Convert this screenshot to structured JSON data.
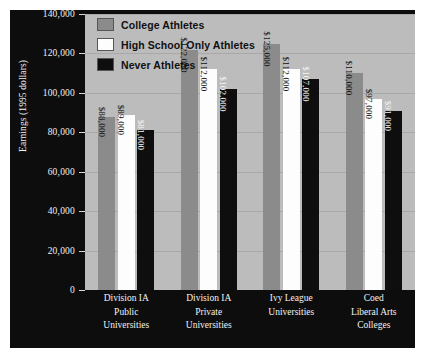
{
  "chart_data": {
    "type": "bar",
    "title": "",
    "subtitle": "",
    "xlabel": "",
    "ylabel": "Earnings (1995 dollars)",
    "ylim": [
      0,
      140000
    ],
    "ytick_values": [
      0,
      20000,
      40000,
      60000,
      80000,
      100000,
      120000,
      140000
    ],
    "ytick_labels": [
      "0",
      "20,000",
      "40,000",
      "60,000",
      "80,000",
      "100,000",
      "120,000",
      "140,000"
    ],
    "grid": true,
    "legend_position": "top-left",
    "categories": [
      "Division IA Public Universities",
      "Division IA Private Universities",
      "Ivy League Universities",
      "Coed Liberal Arts Colleges"
    ],
    "category_lines": [
      [
        "Division IA",
        "Public",
        "Universities"
      ],
      [
        "Division IA",
        "Private",
        "Universities"
      ],
      [
        "Ivy League",
        "Universities"
      ],
      [
        "Coed",
        "Liberal Arts",
        "Colleges"
      ]
    ],
    "series": [
      {
        "name": "College Athletes",
        "color": "#8b8b8b",
        "values": [
          88000,
          122000,
          125000,
          110000
        ],
        "labels": [
          "$88,000",
          "$122,000",
          "$125,000",
          "$110,000"
        ]
      },
      {
        "name": "High School Only Athletes",
        "color": "#fdfdfd",
        "values": [
          89000,
          112000,
          112000,
          97000
        ],
        "labels": [
          "$89,000",
          "$112,000",
          "$112,000",
          "$97,000"
        ]
      },
      {
        "name": "Never Athletes",
        "color": "#0e0e0e",
        "values": [
          81000,
          102000,
          107000,
          91000
        ],
        "labels": [
          "$81,000",
          "$102,000",
          "$107,000",
          "$91,000"
        ]
      }
    ],
    "colors": {
      "panel_background": "#0d0d0d",
      "plot_background": "#bcbcbc",
      "gridline": "#a8a8a8",
      "axis_text": "#f2f2f2"
    }
  }
}
